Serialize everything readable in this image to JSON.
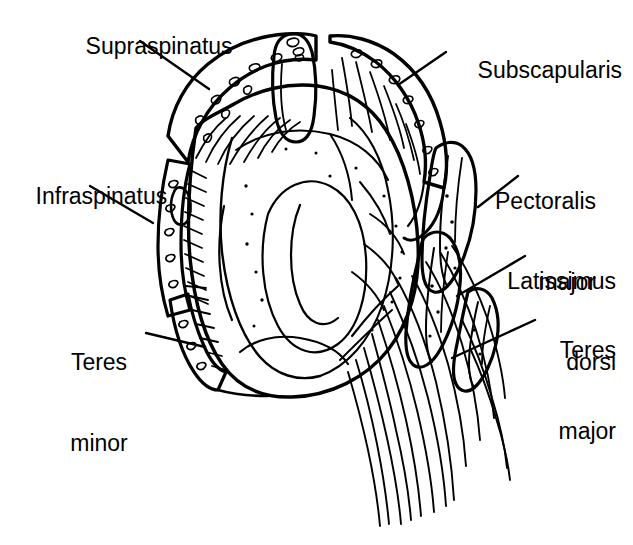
{
  "figure": {
    "background_color": "#ffffff",
    "ink_color": "#000000",
    "style": "black-and-white line drawing / medical illustration",
    "width": 633,
    "height": 545
  },
  "labels": [
    {
      "id": "supraspinatus",
      "text": "Supraspinatus",
      "lines": [
        "Supraspinatus"
      ],
      "x": 60,
      "y": 6,
      "align": "left",
      "leader": {
        "x1": 140,
        "y1": 41,
        "x2": 209,
        "y2": 89
      }
    },
    {
      "id": "subscapularis",
      "text": "Subscapularis",
      "lines": [
        "Subscapularis"
      ],
      "x": 452,
      "y": 30,
      "align": "left",
      "leader": {
        "x1": 446,
        "y1": 52,
        "x2": 398,
        "y2": 85
      }
    },
    {
      "id": "infraspinatus",
      "text": "Infraspinatus",
      "lines": [
        "Infraspinatus"
      ],
      "x": 10,
      "y": 156,
      "align": "left",
      "leader": {
        "x1": 90,
        "y1": 186,
        "x2": 153,
        "y2": 223
      }
    },
    {
      "id": "pectoralis-major",
      "text": "Pectoralis major",
      "lines": [
        "Pectoralis",
        "major"
      ],
      "x": 496,
      "y": 134,
      "align": "right",
      "leader": {
        "x1": 518,
        "y1": 176,
        "x2": 478,
        "y2": 207
      }
    },
    {
      "id": "latissimus-dorsi",
      "text": "Latissimus dorsi",
      "lines": [
        "Latissimus",
        "dorsi"
      ],
      "x": 508,
      "y": 214,
      "align": "right",
      "leader": {
        "x1": 525,
        "y1": 256,
        "x2": 457,
        "y2": 296
      }
    },
    {
      "id": "teres-major",
      "text": "Teres major",
      "lines": [
        "Teres",
        "major"
      ],
      "x": 538,
      "y": 283,
      "align": "right",
      "leader": {
        "x1": 535,
        "y1": 320,
        "x2": 452,
        "y2": 358
      }
    },
    {
      "id": "teres-minor",
      "text": "Teres minor",
      "lines": [
        "Teres",
        "minor"
      ],
      "x": 62,
      "y": 295,
      "align": "center",
      "leader": {
        "x1": 146,
        "y1": 333,
        "x2": 200,
        "y2": 345
      }
    }
  ],
  "anatomy_parts": [
    {
      "id": "glenoid-fossa",
      "name": "Glenoid fossa"
    },
    {
      "id": "coracoid-process",
      "name": "Coracoid process"
    },
    {
      "id": "supraspinatus-footprint",
      "name": "Supraspinatus attachment"
    },
    {
      "id": "subscapularis-footprint",
      "name": "Subscapularis attachment"
    },
    {
      "id": "infraspinatus-footprint",
      "name": "Infraspinatus attachment"
    },
    {
      "id": "teres-minor-footprint",
      "name": "Teres minor attachment"
    },
    {
      "id": "pectoralis-major-bundle",
      "name": "Pectoralis major tendon bundle"
    },
    {
      "id": "latissimus-dorsi-bundle",
      "name": "Latissimus dorsi tendon bundle"
    },
    {
      "id": "teres-major-bundle",
      "name": "Teres major tendon bundle"
    }
  ]
}
